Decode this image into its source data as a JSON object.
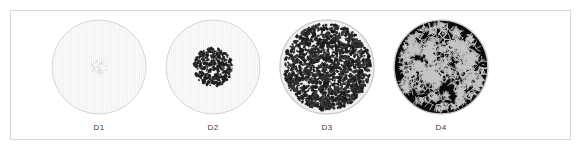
{
  "figure": {
    "background_color": "#ffffff",
    "frame_color": "#d8d8d8",
    "label_color": "#3b3b3b"
  },
  "chart_data": {
    "type": "table",
    "title": "",
    "xlabel": "",
    "ylabel": "",
    "legend": [],
    "categories": [
      "D1",
      "D2",
      "D3",
      "D4"
    ],
    "series": [
      {
        "name": "porosity_fraction",
        "values": [
          0.03,
          0.18,
          0.62,
          0.82
        ]
      },
      {
        "name": "pore_cluster_radius_fraction",
        "values": [
          0.18,
          0.42,
          0.94,
          0.96
        ]
      },
      {
        "name": "mean_pore_size_px",
        "values": [
          1.1,
          2.0,
          2.6,
          5.2
        ]
      },
      {
        "name": "pore_count",
        "values": [
          60,
          420,
          1500,
          520
        ]
      }
    ],
    "samples": [
      {
        "label": "D1",
        "description": "sparse faint speckle cluster at disc center",
        "fill_color": "#fbfbfb",
        "pore_color": "#c9c9c9",
        "rim_color": "#d5d5d5",
        "porosity": 0.03,
        "cluster_radius_fraction": 0.18,
        "pore_count": 60,
        "mean_pore_size_px": 1.1
      },
      {
        "label": "D2",
        "description": "moderate dark dot cluster covering central region",
        "fill_color": "#fbfbfb",
        "pore_color": "#1c1c1c",
        "rim_color": "#d5d5d5",
        "porosity": 0.18,
        "cluster_radius_fraction": 0.42,
        "pore_count": 420,
        "mean_pore_size_px": 2.0
      },
      {
        "label": "D3",
        "description": "dense fine cellular foam filling disc with thin light rim",
        "fill_color": "#f2f2f2",
        "pore_color": "#151515",
        "rim_color": "#cdcdcd",
        "porosity": 0.62,
        "cluster_radius_fraction": 0.94,
        "pore_count": 1500,
        "mean_pore_size_px": 2.6
      },
      {
        "label": "D4",
        "description": "coarse near-black foam with thin bright cell walls",
        "fill_color": "#0a0a0a",
        "pore_color": "#050505",
        "rim_color": "#cdcdcd",
        "porosity": 0.82,
        "cluster_radius_fraction": 0.96,
        "pore_count": 520,
        "mean_pore_size_px": 5.2
      }
    ]
  }
}
